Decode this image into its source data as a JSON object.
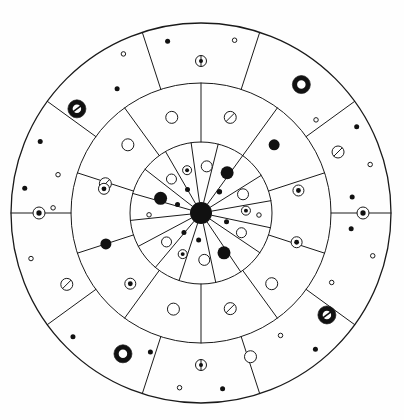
{
  "figure": {
    "kind": "radial-mandala-diagram",
    "background_color": "#fefefe",
    "stroke_color": "#1a1a1a",
    "fill_color": "#111111",
    "open_fill": "#ffffff",
    "canvas": {
      "width": 404,
      "height": 420
    },
    "center": {
      "x": 201,
      "y": 213
    },
    "radii": {
      "outer": 190,
      "ring_outer_inner": 130,
      "ring_middle_inner": 71,
      "hub": 11
    },
    "line_width_thin": 1.0,
    "line_width_rim": 1.3
  },
  "rings": [
    {
      "name": "outer-ring",
      "r_inner": 130,
      "r_outer": 190,
      "sector_count": 10,
      "sector_start_deg": -72,
      "spoke_angles_deg": [
        -72,
        -36,
        0,
        36,
        72,
        108,
        144,
        180,
        216,
        252
      ]
    },
    {
      "name": "middle-ring",
      "r_inner": 71,
      "r_outer": 130,
      "sector_count": 10,
      "sector_start_deg": -90,
      "spoke_angles_deg": [
        -90,
        -54,
        -18,
        18,
        54,
        90,
        126,
        162,
        198,
        234
      ]
    },
    {
      "name": "inner-ring",
      "r_inner": 11,
      "r_outer": 71,
      "sector_count": 16,
      "sector_start_deg": -78,
      "spoke_angles_deg": [
        -78,
        -56,
        -34,
        -12,
        10,
        32,
        54,
        76,
        98,
        120,
        142,
        164,
        186,
        208,
        230,
        252
      ]
    }
  ],
  "markers": {
    "legend_types": [
      {
        "id": "dot",
        "label": "filled dot"
      },
      {
        "id": "open",
        "label": "open circle"
      },
      {
        "id": "dotted",
        "label": "circle with centered dot"
      },
      {
        "id": "slashed",
        "label": "circle with diagonal slash"
      },
      {
        "id": "annulus",
        "label": "thick filled ring"
      },
      {
        "id": "annulus_slashed",
        "label": "thick filled ring with slash"
      },
      {
        "id": "crosshair",
        "label": "circle with vertical line and dot"
      },
      {
        "id": "hub",
        "label": "central filled hub"
      }
    ],
    "outer": [
      {
        "type": "dot",
        "a": 101,
        "r": 175,
        "s": 5.0
      },
      {
        "type": "open",
        "a": 79,
        "r": 176,
        "s": 4.5
      },
      {
        "type": "crosshair",
        "a": 90,
        "r": 152,
        "s": 11
      },
      {
        "type": "annulus",
        "a": 52,
        "r": 163,
        "s": 18,
        "hole": 8.5
      },
      {
        "type": "dot",
        "a": 29,
        "r": 178,
        "s": 5.0
      },
      {
        "type": "open",
        "a": 39,
        "r": 148,
        "s": 4.5
      },
      {
        "type": "slashed",
        "a": 24,
        "r": 150,
        "s": 12
      },
      {
        "type": "open",
        "a": 16,
        "r": 176,
        "s": 4.5
      },
      {
        "type": "dot",
        "a": 6,
        "r": 152,
        "s": 5.0
      },
      {
        "type": "dotted",
        "a": 0,
        "r": 162,
        "s": 12
      },
      {
        "type": "dot",
        "a": -6,
        "r": 151,
        "s": 5.0
      },
      {
        "type": "open",
        "a": -14,
        "r": 177,
        "s": 4.5
      },
      {
        "type": "annulus_slashed",
        "a": -39,
        "r": 162,
        "s": 18,
        "hole": 8.5
      },
      {
        "type": "open",
        "a": -28,
        "r": 148,
        "s": 4.5
      },
      {
        "type": "dot",
        "a": -50,
        "r": 178,
        "s": 5.0
      },
      {
        "type": "open",
        "a": -57,
        "r": 146,
        "s": 4.5
      },
      {
        "type": "open",
        "a": -71,
        "r": 152,
        "s": 12
      },
      {
        "type": "dot",
        "a": -83,
        "r": 177,
        "s": 5.0
      },
      {
        "type": "open",
        "a": -97,
        "r": 176,
        "s": 4.5
      },
      {
        "type": "crosshair",
        "a": -90,
        "r": 152,
        "s": 11
      },
      {
        "type": "annulus",
        "a": -119,
        "r": 161,
        "s": 18,
        "hole": 8.5
      },
      {
        "type": "dot",
        "a": -136,
        "r": 178,
        "s": 5.0
      },
      {
        "type": "dot",
        "a": -110,
        "r": 148,
        "s": 5.0
      },
      {
        "type": "slashed",
        "a": -152,
        "r": 152,
        "s": 12
      },
      {
        "type": "open",
        "a": -165,
        "r": 176,
        "s": 4.5
      },
      {
        "type": "open",
        "a": 178,
        "r": 148,
        "s": 4.5
      },
      {
        "type": "dotted",
        "a": 180,
        "r": 162,
        "s": 12
      },
      {
        "type": "dot",
        "a": 172,
        "r": 178,
        "s": 5.0
      },
      {
        "type": "open",
        "a": 165,
        "r": 148,
        "s": 4.5
      },
      {
        "type": "annulus_slashed",
        "a": 140,
        "r": 162,
        "s": 18,
        "hole": 8.5
      },
      {
        "type": "dot",
        "a": 156,
        "r": 176,
        "s": 5.0
      },
      {
        "type": "dot",
        "a": 124,
        "r": 150,
        "s": 5.0
      },
      {
        "type": "open",
        "a": 116,
        "r": 177,
        "s": 4.5
      }
    ],
    "middle": [
      {
        "type": "open",
        "a": 107,
        "r": 100,
        "s": 12
      },
      {
        "type": "slashed",
        "a": 73,
        "r": 100,
        "s": 12
      },
      {
        "type": "dot",
        "a": 43,
        "r": 100,
        "s": 11
      },
      {
        "type": "dotted",
        "a": 13,
        "r": 100,
        "s": 11
      },
      {
        "type": "dotted",
        "a": -17,
        "r": 100,
        "s": 11
      },
      {
        "type": "open",
        "a": -45,
        "r": 100,
        "s": 12
      },
      {
        "type": "slashed",
        "a": -73,
        "r": 100,
        "s": 12
      },
      {
        "type": "open",
        "a": -106,
        "r": 100,
        "s": 12
      },
      {
        "type": "dotted",
        "a": -135,
        "r": 100,
        "s": 11
      },
      {
        "type": "dot",
        "a": -162,
        "r": 100,
        "s": 11
      },
      {
        "type": "slashed",
        "a": 163,
        "r": 100,
        "s": 12
      },
      {
        "type": "open",
        "a": 137,
        "r": 100,
        "s": 12
      },
      {
        "type": "dotted",
        "a": 166,
        "r": 100,
        "s": 11
      }
    ],
    "inner": [
      {
        "type": "open",
        "a": 83,
        "r": 47,
        "s": 11
      },
      {
        "type": "dotted",
        "a": 108,
        "r": 45,
        "s": 9
      },
      {
        "type": "dot",
        "a": 57,
        "r": 48,
        "s": 13
      },
      {
        "type": "open",
        "a": 131,
        "r": 45,
        "s": 10
      },
      {
        "type": "dot",
        "a": 49,
        "r": 28,
        "s": 5.5
      },
      {
        "type": "dot",
        "a": 120,
        "r": 27,
        "s": 5
      },
      {
        "type": "dot",
        "a": 160,
        "r": 43,
        "s": 13
      },
      {
        "type": "open",
        "a": 24,
        "r": 46,
        "s": 11
      },
      {
        "type": "dotted",
        "a": 3,
        "r": 45,
        "s": 9
      },
      {
        "type": "open",
        "a": 182,
        "r": 52,
        "s": 4.5
      },
      {
        "type": "open",
        "a": -2,
        "r": 58,
        "s": 4.5
      },
      {
        "type": "dot",
        "a": -19,
        "r": 27,
        "s": 5
      },
      {
        "type": "open",
        "a": -26,
        "r": 45,
        "s": 10
      },
      {
        "type": "dot",
        "a": -60,
        "r": 46,
        "s": 13
      },
      {
        "type": "open",
        "a": -86,
        "r": 47,
        "s": 11
      },
      {
        "type": "dotted",
        "a": -114,
        "r": 45,
        "s": 9
      },
      {
        "type": "open",
        "a": -140,
        "r": 45,
        "s": 10
      },
      {
        "type": "dot",
        "a": -131,
        "r": 26,
        "s": 5
      },
      {
        "type": "dot",
        "a": -95,
        "r": 27,
        "s": 5
      },
      {
        "type": "dot",
        "a": 160,
        "r": 25,
        "s": 5
      }
    ]
  }
}
